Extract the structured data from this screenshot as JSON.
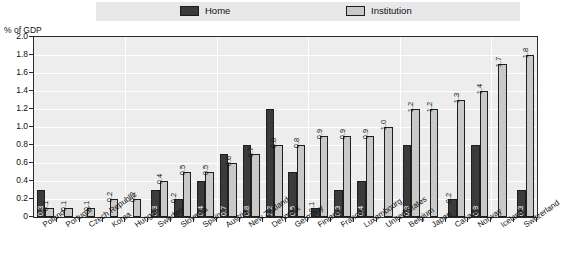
{
  "legend": {
    "items": [
      {
        "label": "Home",
        "color": "#3b3b3b",
        "key": "home"
      },
      {
        "label": "Institution",
        "color": "#c9c9c9",
        "key": "institution"
      }
    ]
  },
  "axis": {
    "y_title": "% of GDP",
    "y_ticks": [
      "0",
      "0.2",
      "0.4",
      "0.6",
      "0.8",
      "1.0",
      "1.2",
      "1.4",
      "1.6",
      "1.8",
      "2.0"
    ]
  },
  "chart_data": {
    "type": "bar",
    "title": "",
    "xlabel": "",
    "ylabel": "% of GDP",
    "ylim": [
      0,
      2.0
    ],
    "ytick_step": 0.2,
    "grid": true,
    "legend_position": "top",
    "categories": [
      "Poland",
      "Portugal",
      "Czech Republic",
      "Korea",
      "Hungary",
      "Sweden",
      "Slovenia",
      "Spain",
      "Austria",
      "New Zealand",
      "Denmark",
      "Germany",
      "Finland",
      "France",
      "Luxembourg",
      "United States",
      "Belgium",
      "Japan",
      "Canada",
      "Norway",
      "Iceland",
      "Switzerland"
    ],
    "series": [
      {
        "name": "Home",
        "color": "#3b3b3b",
        "values": [
          0.3,
          null,
          null,
          null,
          null,
          0.3,
          0.2,
          0.4,
          0.7,
          0.8,
          1.2,
          0.5,
          0.1,
          0.3,
          0.4,
          null,
          0.8,
          null,
          0.2,
          0.8,
          null,
          0.3
        ],
        "labels": [
          "0.3",
          "",
          "",
          "",
          "",
          "0.3",
          "0.2",
          "0.4",
          "0.7",
          "0.8",
          "1.2",
          "0.5",
          "0.1",
          "0.3",
          "0.4",
          "",
          "0.8",
          "",
          "0.2",
          "0.8",
          "",
          "0.3"
        ]
      },
      {
        "name": "Institution",
        "color": "#c9c9c9",
        "values": [
          0.1,
          0.1,
          0.1,
          0.2,
          0.2,
          0.4,
          0.5,
          0.5,
          0.6,
          0.7,
          0.8,
          0.8,
          0.9,
          0.9,
          0.9,
          1.0,
          1.2,
          1.2,
          1.3,
          1.4,
          1.7,
          1.8
        ],
        "labels": [
          "0.1",
          "0.1",
          "0.1",
          "0.2",
          "0.2",
          "0.4",
          "0.5",
          "0.5",
          "0.6",
          "0.7",
          "0.8",
          "0.8",
          "0.9",
          "0.9",
          "0.9",
          "1.0",
          "1.2",
          "1.2",
          "1.3",
          "1.4",
          "1.7",
          "1.8"
        ]
      }
    ]
  }
}
